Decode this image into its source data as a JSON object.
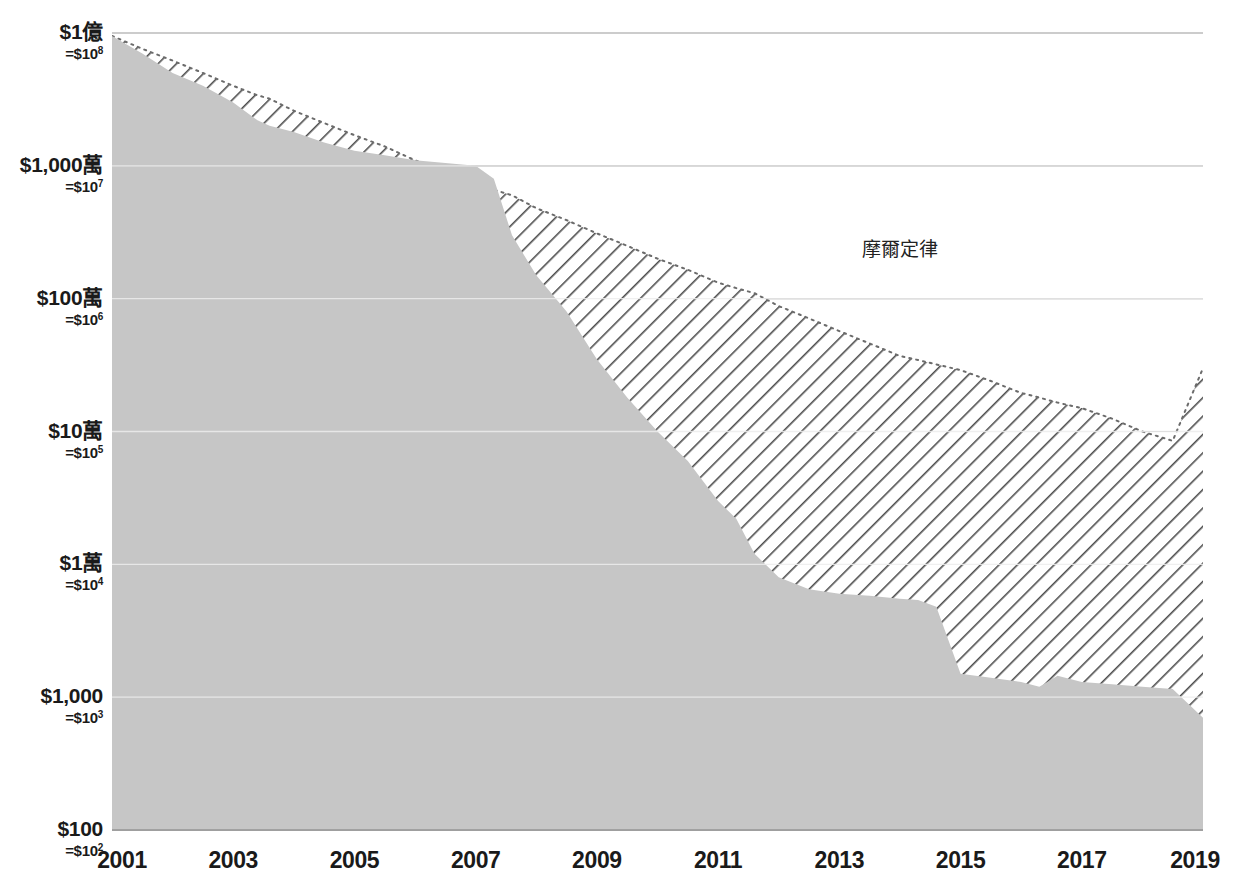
{
  "chart_data": {
    "type": "area",
    "title": "",
    "xlabel": "",
    "ylabel": "",
    "scale": "log",
    "grid": true,
    "legend_position": "inline-annotation",
    "xlim": [
      2001,
      2019
    ],
    "ylim": [
      100,
      100000000
    ],
    "x_tick_labels": [
      "2001",
      "2003",
      "2005",
      "2007",
      "2009",
      "2011",
      "2013",
      "2015",
      "2017",
      "2019"
    ],
    "x_ticks": [
      2001,
      2003,
      2005,
      2007,
      2009,
      2011,
      2013,
      2015,
      2017,
      2019
    ],
    "y_ticks": [
      100,
      1000,
      10000,
      100000,
      1000000,
      10000000,
      100000000
    ],
    "y_tick_labels": [
      {
        "main": "$100",
        "sub": "=$10",
        "exp": "2",
        "value": 100
      },
      {
        "main": "$1,000",
        "sub": "=$10",
        "exp": "3",
        "value": 1000
      },
      {
        "main": "$1萬",
        "sub": "=$10",
        "exp": "4",
        "value": 10000
      },
      {
        "main": "$10萬",
        "sub": "=$10",
        "exp": "5",
        "value": 100000
      },
      {
        "main": "$100萬",
        "sub": "=$10",
        "exp": "6",
        "value": 1000000
      },
      {
        "main": "$1,000萬",
        "sub": "=$10",
        "exp": "7",
        "value": 10000000
      },
      {
        "main": "$1億",
        "sub": "=$10",
        "exp": "8",
        "value": 100000000
      }
    ],
    "annotations": [
      {
        "text": "摩爾定律",
        "x": 2014.0,
        "y": 2100000
      }
    ],
    "x": [
      2001,
      2001.5,
      2002,
      2002.5,
      2003,
      2003.4,
      2003.6,
      2004,
      2004.5,
      2005,
      2005.5,
      2006,
      2006.5,
      2007,
      2007.3,
      2007.6,
      2008,
      2008.5,
      2009,
      2009.5,
      2010,
      2010.5,
      2011,
      2011.3,
      2011.6,
      2012,
      2012.5,
      2013,
      2013.5,
      2014,
      2014.3,
      2014.6,
      2015,
      2015.5,
      2016,
      2016.3,
      2016.6,
      2017,
      2017.5,
      2018,
      2018.5,
      2019
    ],
    "series": [
      {
        "name": "定序成本",
        "fill": "hatched-solid-gray",
        "values": [
          95000000,
          70000000,
          50000000,
          40000000,
          30000000,
          22000000,
          20000000,
          18000000,
          15000000,
          13000000,
          12000000,
          11000000,
          10500000,
          10000000,
          8000000,
          3000000,
          1500000,
          800000,
          350000,
          180000,
          100000,
          60000,
          30000,
          22000,
          12000,
          8000,
          6500,
          6000,
          5800,
          5500,
          5400,
          4800,
          1500,
          1400,
          1300,
          1200,
          1450,
          1300,
          1250,
          1200,
          1150,
          700
        ]
      },
      {
        "name": "摩爾定律",
        "fill": "diagonal-hatch",
        "values": [
          95000000,
          76000000,
          62000000,
          50000000,
          40000000,
          34000000,
          32000000,
          26000000,
          21000000,
          17000000,
          14000000,
          11000000,
          9000000,
          7200000,
          6600000,
          6000000,
          4800000,
          3900000,
          3100000,
          2500000,
          2000000,
          1650000,
          1320000,
          1200000,
          1100000,
          880000,
          710000,
          570000,
          460000,
          370000,
          345000,
          320000,
          290000,
          240000,
          195000,
          180000,
          165000,
          150000,
          125000,
          100000,
          85000,
          300000
        ]
      }
    ]
  },
  "axes": {
    "plot_left": 112,
    "plot_right": 1203,
    "plot_top": 33,
    "plot_bottom": 830
  },
  "colors": {
    "area_fill": "#c6c6c6",
    "hatch_stroke": "#4d4d4d",
    "gridline": "#9a9a9a",
    "gridline_light": "#e8e8e8",
    "text": "#1a1a1a",
    "background": "#ffffff"
  }
}
